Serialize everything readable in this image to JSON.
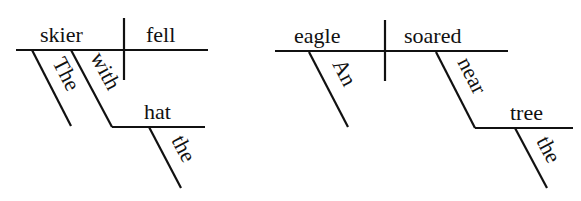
{
  "colors": {
    "ink": "#111111",
    "background": "#ffffff"
  },
  "diagrams": [
    {
      "sentence": "The skier with the hat fell",
      "subject": "skier",
      "predicate": "fell",
      "modifiers": {
        "article": "The",
        "preposition": "with",
        "object": "hat",
        "object_article": "the"
      }
    },
    {
      "sentence": "An eagle soared near the tree",
      "subject": "eagle",
      "predicate": "soared",
      "modifiers": {
        "article": "An",
        "preposition": "near",
        "object": "tree",
        "object_article": "the"
      }
    }
  ]
}
